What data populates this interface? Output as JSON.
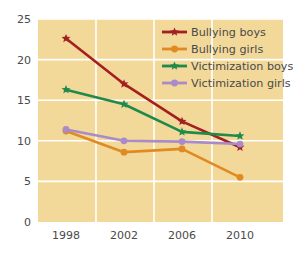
{
  "chart_data": {
    "type": "line",
    "title": "",
    "subtitle": "",
    "xlabel": "",
    "ylabel": "",
    "categories": [
      "1998",
      "2002",
      "2006",
      "2010"
    ],
    "x": [
      1998,
      2002,
      2006,
      2010
    ],
    "xlim": [
      1998,
      2010
    ],
    "ylim": [
      0,
      25
    ],
    "yticks": [
      "0",
      "5",
      "10",
      "15",
      "20",
      "25"
    ],
    "ytick_values": [
      0,
      5,
      10,
      15,
      20,
      25
    ],
    "grid": true,
    "grid_color": "#ffffff",
    "plot_background": "#f2d99a",
    "legend_position": "top-right",
    "series": [
      {
        "name": "Bullying boys",
        "color": "#a32020",
        "marker": "star",
        "values": [
          22.6,
          17.0,
          12.4,
          9.2
        ]
      },
      {
        "name": "Bullying girls",
        "color": "#e08a22",
        "marker": "circle",
        "values": [
          11.2,
          8.6,
          9.0,
          5.5
        ]
      },
      {
        "name": "Victimization  boys",
        "color": "#1f8a4c",
        "marker": "star",
        "values": [
          16.3,
          14.5,
          11.1,
          10.6
        ]
      },
      {
        "name": "Victimization girls",
        "color": "#a88bc8",
        "marker": "circle",
        "values": [
          11.4,
          10.0,
          9.9,
          9.6
        ]
      }
    ]
  },
  "axes": {
    "y_tick_labels": [
      "25",
      "20",
      "15",
      "10",
      "5",
      "0"
    ],
    "x_tick_labels": [
      "1998",
      "2002",
      "2006",
      "2010"
    ]
  },
  "legend": {
    "entries": [
      {
        "label": "Bullying boys",
        "color": "#a32020",
        "marker": "star"
      },
      {
        "label": "Bullying girls",
        "color": "#e08a22",
        "marker": "circle"
      },
      {
        "label": "Victimization  boys",
        "color": "#1f8a4c",
        "marker": "star"
      },
      {
        "label": "Victimization girls",
        "color": "#a88bc8",
        "marker": "circle"
      }
    ]
  },
  "colors": {
    "background": "#ffffff",
    "plot_area": "#f2d99a",
    "gridline": "#ffffff",
    "text": "#4a4a48",
    "bullying_boys": "#a32020",
    "bullying_girls": "#e08a22",
    "victimization_boys": "#1f8a4c",
    "victimization_girls": "#a88bc8"
  }
}
